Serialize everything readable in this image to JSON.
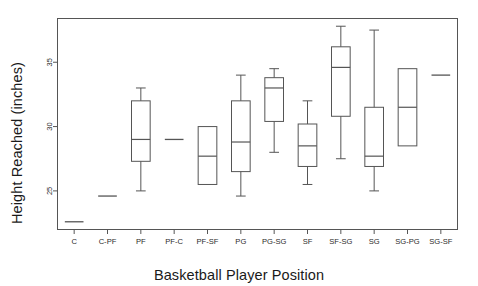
{
  "chart_data": {
    "type": "box",
    "title": "",
    "xlabel": "Basketball Player Position",
    "ylabel": "Height Reached (inches)",
    "grid": false,
    "legend": "none",
    "xlim_categories": 12,
    "ylim": [
      22.0,
      38.4
    ],
    "yticks": [
      25,
      30,
      35
    ],
    "ytick_labels": [
      "25",
      "30",
      "35"
    ],
    "categories": [
      "C",
      "C-PF",
      "PF",
      "PF-C",
      "PF-SF",
      "PG",
      "PG-SG",
      "SF",
      "SF-SG",
      "SG",
      "SG-PG",
      "SG-SF"
    ],
    "boxes": [
      {
        "category": "C",
        "whisker_low": 22.6,
        "q1": 22.6,
        "median": 22.6,
        "q3": 22.6,
        "whisker_high": 22.6,
        "degenerate": true
      },
      {
        "category": "C-PF",
        "whisker_low": 24.6,
        "q1": 24.6,
        "median": 24.6,
        "q3": 24.6,
        "whisker_high": 24.6,
        "degenerate": true
      },
      {
        "category": "PF",
        "whisker_low": 25.0,
        "q1": 27.3,
        "median": 29.0,
        "q3": 32.0,
        "whisker_high": 33.0,
        "degenerate": false
      },
      {
        "category": "PF-C",
        "whisker_low": 29.0,
        "q1": 29.0,
        "median": 29.0,
        "q3": 29.0,
        "whisker_high": 29.0,
        "degenerate": true
      },
      {
        "category": "PF-SF",
        "whisker_low": 25.5,
        "q1": 25.5,
        "median": 27.7,
        "q3": 30.0,
        "whisker_high": 30.0,
        "degenerate": false
      },
      {
        "category": "PG",
        "whisker_low": 24.6,
        "q1": 26.5,
        "median": 28.8,
        "q3": 32.0,
        "whisker_high": 34.0,
        "degenerate": false
      },
      {
        "category": "PG-SG",
        "whisker_low": 28.0,
        "q1": 30.4,
        "median": 33.0,
        "q3": 33.8,
        "whisker_high": 34.5,
        "degenerate": false
      },
      {
        "category": "SF",
        "whisker_low": 25.5,
        "q1": 26.9,
        "median": 28.5,
        "q3": 30.2,
        "whisker_high": 32.0,
        "degenerate": false
      },
      {
        "category": "SF-SG",
        "whisker_low": 27.5,
        "q1": 30.8,
        "median": 34.6,
        "q3": 36.2,
        "whisker_high": 37.8,
        "degenerate": false
      },
      {
        "category": "SG",
        "whisker_low": 25.0,
        "q1": 26.9,
        "median": 27.7,
        "q3": 31.5,
        "whisker_high": 37.5,
        "degenerate": false
      },
      {
        "category": "SG-PG",
        "whisker_low": 28.5,
        "q1": 28.5,
        "median": 31.5,
        "q3": 34.5,
        "whisker_high": 34.5,
        "degenerate": false
      },
      {
        "category": "SG-SF",
        "whisker_low": 34.0,
        "q1": 34.0,
        "median": 34.0,
        "q3": 34.0,
        "whisker_high": 34.0,
        "degenerate": true
      }
    ],
    "colors": {
      "box_stroke": "#555555",
      "median_stroke": "#555555",
      "whisker_stroke": "#555555",
      "axis_stroke": "#555555",
      "frame_stroke": "#555555",
      "background": "#ffffff",
      "text": "#1a1a1a"
    }
  }
}
